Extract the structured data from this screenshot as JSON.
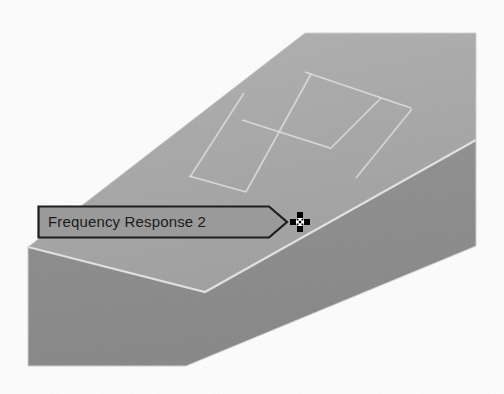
{
  "viewport": {
    "name": "3d-model-viewport",
    "background_color": "#fdfdfd",
    "solid": {
      "name": "extruded-beam",
      "top_face_color": "#a9a9a9",
      "front_face_color": "#8c8c8c",
      "edge_color": "#e8e8e8",
      "mesh_line_color": "#dcdcdc",
      "segment_count": 3
    }
  },
  "callout": {
    "label": "Frequency Response 2",
    "fill_color": "#9a9a9a",
    "border_color": "#1e1e1e",
    "text_color": "#1b1b1b",
    "shape": "pointed-right-tag"
  },
  "cursor": {
    "icon": "move-crosshair-cursor",
    "color": "#000000"
  }
}
